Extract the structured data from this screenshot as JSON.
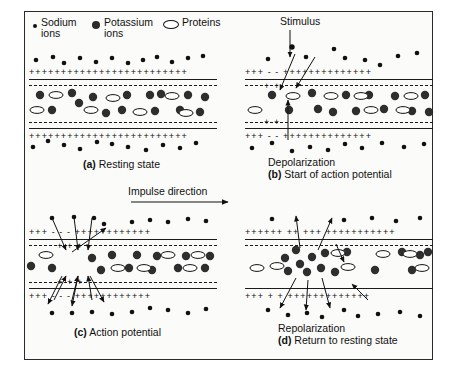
{
  "figure": {
    "background": "#fbfbf9",
    "ink": "#111111"
  },
  "legend": {
    "items": [
      {
        "icon": "small-filled-circle",
        "line1": "Sodium",
        "line2": "ions"
      },
      {
        "icon": "large-filled-circle",
        "line1": "Potassium",
        "line2": "ions"
      },
      {
        "icon": "open-ellipse",
        "line1": "Proteins",
        "line2": ""
      }
    ]
  },
  "annotations": {
    "stimulus": "Stimulus",
    "impulse_direction": "Impulse direction"
  },
  "panels": [
    {
      "id": "a",
      "caption_line1": "",
      "caption_letter": "(a)",
      "caption_text": "Resting state",
      "outside_top_charge": "+++++++++++++++++++++++++",
      "inside_top_charge": "-------------------------",
      "inside_bottom_charge": "-------------------------",
      "outside_bottom_charge": "+++++++++++++++++++++++++"
    },
    {
      "id": "b",
      "caption_line1": "Depolarization",
      "caption_letter": "(b)",
      "caption_text": "Start of action potential",
      "outside_top_charge": "+++  -  -  ++++++++++++++",
      "inside_top_charge": "---  +  +  --------------",
      "inside_bottom_charge": "---  +  +  --------------",
      "outside_bottom_charge": "+++  -  -  ++++++++++++++"
    },
    {
      "id": "c",
      "caption_line1": "",
      "caption_letter": "(c)",
      "caption_text": "Action potential",
      "outside_top_charge": "+++ - - - ++++++++++++",
      "inside_top_charge": "--- + + + ------------",
      "inside_bottom_charge": "--- + + + ------------",
      "outside_bottom_charge": "+++ - - - ++++++++++++"
    },
    {
      "id": "d",
      "caption_line1": "Repolarization",
      "caption_letter": "(d)",
      "caption_text": "Return to resting state",
      "outside_top_charge": "++++++ ++ +++ +++++++++++",
      "inside_top_charge": "------------------------",
      "inside_bottom_charge": "------------------------",
      "outside_bottom_charge": "+++ + + +++++++++++++"
    }
  ]
}
